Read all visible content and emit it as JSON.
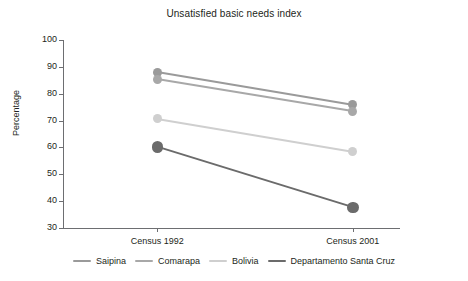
{
  "chart_data": {
    "type": "line",
    "title": "Unsatisfied basic needs index",
    "xlabel": "",
    "ylabel": "Percentage",
    "categories": [
      "Census 1992",
      "Census 2001"
    ],
    "ylim": [
      30,
      100
    ],
    "yticks": [
      30,
      40,
      50,
      60,
      70,
      80,
      90,
      100
    ],
    "ytick_labels": [
      "30",
      "40",
      "50",
      "60",
      "70",
      "80",
      "90",
      "100"
    ],
    "grid": false,
    "legend_position": "bottom",
    "series": [
      {
        "name": "Saipina",
        "values": [
          88.0,
          75.8
        ],
        "color": "#9a9a9a",
        "width": 2.0
      },
      {
        "name": "Comarapa",
        "values": [
          85.3,
          73.4
        ],
        "color": "#a8a8a8",
        "width": 2.0
      },
      {
        "name": "Bolivia",
        "values": [
          70.7,
          58.5
        ],
        "color": "#cfcfcf",
        "width": 2.0
      },
      {
        "name": "Departamento Santa Cruz",
        "values": [
          60.2,
          37.7
        ],
        "color": "#6b6b6b",
        "width": 2.8
      }
    ]
  },
  "axis": {
    "line_color": "#6d6e71",
    "text_color": "#231f20"
  }
}
